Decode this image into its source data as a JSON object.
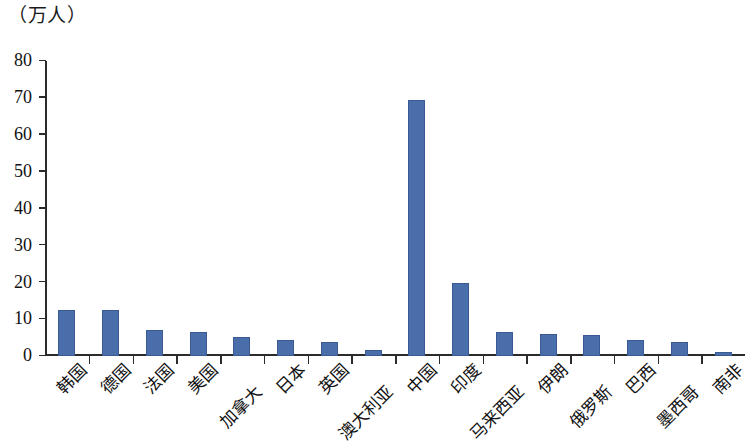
{
  "chart_data": {
    "type": "bar",
    "title": "",
    "subtitle": "",
    "unit_caption": "（万人）",
    "xlabel": "",
    "ylabel": "",
    "ylim": [
      0,
      80
    ],
    "ytick_values": [
      0,
      10,
      20,
      30,
      40,
      50,
      60,
      70,
      80
    ],
    "ytick_labels": [
      "0",
      "10",
      "20",
      "30",
      "40",
      "50",
      "60",
      "70",
      "80"
    ],
    "grid": false,
    "legend": null,
    "bar_color": "#4a6ea9",
    "axis_color": "#2b2b2b",
    "categories": [
      "韩国",
      "德国",
      "法国",
      "美国",
      "加拿大",
      "日本",
      "英国",
      "澳大利亚",
      "中国",
      "印度",
      "马来西亚",
      "伊朗",
      "俄罗斯",
      "巴西",
      "墨西哥",
      "南非"
    ],
    "values": [
      12.6,
      12.5,
      7.0,
      6.5,
      5.2,
      4.4,
      3.7,
      1.7,
      69.5,
      19.8,
      6.4,
      5.9,
      5.8,
      4.3,
      3.7,
      1.0
    ],
    "label_rows": [
      0,
      0,
      0,
      0,
      1,
      0,
      0,
      1,
      0,
      0,
      1,
      0,
      1,
      0,
      1,
      0
    ]
  }
}
